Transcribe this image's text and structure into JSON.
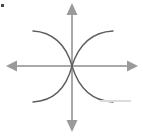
{
  "figure": {
    "background_color": "#ffffff",
    "width": 143,
    "height": 136
  },
  "axes": {
    "color": "#a9a9a9",
    "stroke_width": 2,
    "origin": {
      "x": 72,
      "y": 66
    },
    "x_axis": {
      "name": "horizontal-axis",
      "x1": 12,
      "y1": 66,
      "x2": 132,
      "y2": 66,
      "left_arrow": true,
      "right_arrow": true,
      "label": ""
    },
    "y_axis": {
      "name": "vertical-axis",
      "x1": 72,
      "y1": 10,
      "x2": 72,
      "y2": 124,
      "up_arrow": true,
      "down_arrow": true,
      "label": ""
    },
    "arrow_size": 7
  },
  "chart_data": {
    "type": "line",
    "xlabel": "",
    "ylabel": "",
    "grid": false,
    "legend": null,
    "axis_origin_px": {
      "x": 72,
      "y": 66
    },
    "xlim": [
      -72,
      71
    ],
    "ylim": [
      -70,
      66
    ],
    "curve_color": "#5e5e5e",
    "curve_stroke_width": 1.4,
    "series": [
      {
        "name": "upper-left-branch",
        "path": "M 33 31 C 52 32, 66 44, 72 66",
        "endpoints_px": [
          {
            "x": 33,
            "y": 31
          },
          {
            "x": 72,
            "y": 66
          }
        ]
      },
      {
        "name": "upper-right-branch",
        "path": "M 113 31 C 93 32, 79 44, 72 66",
        "endpoints_px": [
          {
            "x": 113,
            "y": 31
          },
          {
            "x": 72,
            "y": 66
          }
        ]
      },
      {
        "name": "lower-left-branch",
        "path": "M 33 102 C 52 101, 66 89, 72 66",
        "endpoints_px": [
          {
            "x": 33,
            "y": 102
          },
          {
            "x": 72,
            "y": 66
          }
        ]
      },
      {
        "name": "lower-right-branch",
        "path": "M 113 102 C 93 101, 79 89, 72 66",
        "endpoints_px": [
          {
            "x": 113,
            "y": 102
          },
          {
            "x": 72,
            "y": 66
          }
        ]
      }
    ]
  },
  "artifacts": {
    "corner_speck": {
      "name": "scan-speck-top-left",
      "color": "#4a4a4a"
    },
    "edge_smudge": {
      "name": "scan-smudge-bottom-right",
      "color": "#dcdcdc"
    }
  }
}
